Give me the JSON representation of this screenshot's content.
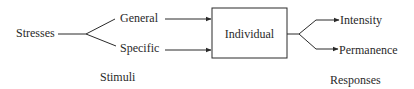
{
  "diagram": {
    "type": "flow",
    "input": {
      "label": "Stresses"
    },
    "stimuli": [
      {
        "label": "General"
      },
      {
        "label": "Specific"
      }
    ],
    "stimuli_caption": "Stimuli",
    "center": {
      "label": "Individual"
    },
    "responses": [
      {
        "label": "Intensity"
      },
      {
        "label": "Permanence"
      }
    ],
    "responses_caption": "Responses",
    "colors": {
      "ink": "#2a2a2a",
      "background": "#ffffff"
    }
  }
}
